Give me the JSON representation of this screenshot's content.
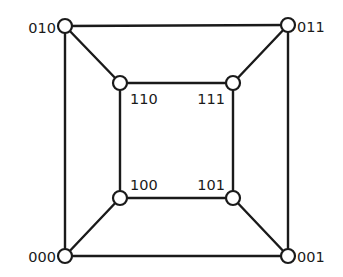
{
  "diagram": {
    "nodes": [
      {
        "id": "010",
        "label": "010"
      },
      {
        "id": "011",
        "label": "011"
      },
      {
        "id": "110",
        "label": "110"
      },
      {
        "id": "111",
        "label": "111"
      },
      {
        "id": "100",
        "label": "100"
      },
      {
        "id": "101",
        "label": "101"
      },
      {
        "id": "000",
        "label": "000"
      },
      {
        "id": "001",
        "label": "001"
      }
    ],
    "edges": [
      [
        "010",
        "011"
      ],
      [
        "010",
        "000"
      ],
      [
        "011",
        "001"
      ],
      [
        "000",
        "001"
      ],
      [
        "110",
        "111"
      ],
      [
        "110",
        "100"
      ],
      [
        "111",
        "101"
      ],
      [
        "100",
        "101"
      ],
      [
        "010",
        "110"
      ],
      [
        "011",
        "111"
      ],
      [
        "000",
        "100"
      ],
      [
        "001",
        "101"
      ]
    ],
    "colors": {
      "stroke": "#1a1a1a",
      "node_fill": "#ffffff",
      "background": "#ffffff"
    }
  }
}
